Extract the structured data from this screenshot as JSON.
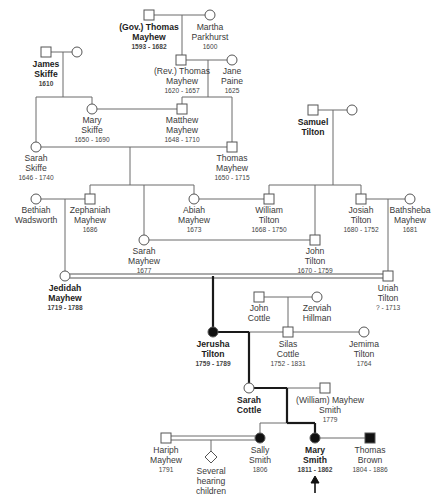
{
  "diagram": {
    "type": "pedigree-chart",
    "colors": {
      "line": "#6b6b6b",
      "bold_line": "#1a1a1a",
      "symbol_stroke": "#555555",
      "affected_fill": "#111111"
    }
  },
  "people": {
    "gov_thomas": {
      "name1": "(Gov.) Thomas",
      "name2": "Mayhew",
      "dates": "1593 - 1682",
      "sex": "male",
      "bold": true
    },
    "martha": {
      "name1": "Martha",
      "name2": "Parkhurst",
      "dates": "1600",
      "sex": "female"
    },
    "james_skiffe": {
      "name1": "James",
      "name2": "Skiffe",
      "dates": "1610",
      "sex": "male",
      "bold": true
    },
    "rev_thomas": {
      "name1": "(Rev.) Thomas",
      "name2": "Mayhew",
      "dates": "1620 - 1657",
      "sex": "male"
    },
    "jane_paine": {
      "name1": "Jane",
      "name2": "Paine",
      "dates": "1625",
      "sex": "female"
    },
    "mary_skiffe": {
      "name1": "Mary",
      "name2": "Skiffe",
      "dates": "1650 - 1690",
      "sex": "female"
    },
    "matthew": {
      "name1": "Matthew",
      "name2": "Mayhew",
      "dates": "1648 - 1710",
      "sex": "male"
    },
    "samuel_tilton": {
      "name1": "Samuel",
      "name2": "Tilton",
      "dates": "",
      "sex": "male",
      "bold": true
    },
    "sarah_skiffe": {
      "name1": "Sarah",
      "name2": "Skiffe",
      "dates": "1646 - 1740",
      "sex": "female"
    },
    "thomas_mayhew": {
      "name1": "Thomas",
      "name2": "Mayhew",
      "dates": "1650 - 1715",
      "sex": "male"
    },
    "bethiah": {
      "name1": "Bethiah",
      "name2": "Wadsworth",
      "dates": "",
      "sex": "female"
    },
    "zephaniah": {
      "name1": "Zephaniah",
      "name2": "Mayhew",
      "dates": "1686",
      "sex": "male"
    },
    "abiah": {
      "name1": "Abiah",
      "name2": "Mayhew",
      "dates": "1673",
      "sex": "female"
    },
    "william_tilton": {
      "name1": "William",
      "name2": "Tilton",
      "dates": "1668 - 1750",
      "sex": "male"
    },
    "josiah": {
      "name1": "Josiah",
      "name2": "Tilton",
      "dates": "1680 - 1752",
      "sex": "male"
    },
    "bathsheba": {
      "name1": "Bathsheba",
      "name2": "Mayhew",
      "dates": "1681",
      "sex": "female"
    },
    "sarah_mayhew": {
      "name1": "Sarah",
      "name2": "Mayhew",
      "dates": "1677",
      "sex": "female"
    },
    "john_tilton": {
      "name1": "John",
      "name2": "Tilton",
      "dates": "1670 - 1759",
      "sex": "male"
    },
    "jedidah": {
      "name1": "Jedidah",
      "name2": "Mayhew",
      "dates": "1719 - 1788",
      "sex": "female",
      "bold": true
    },
    "uriah": {
      "name1": "Uriah",
      "name2": "Tilton",
      "dates": "? - 1713",
      "sex": "male"
    },
    "john_cottle": {
      "name1": "John",
      "name2": "Cottle",
      "dates": "",
      "sex": "male"
    },
    "zerviah": {
      "name1": "Zerviah",
      "name2": "Hillman",
      "dates": "",
      "sex": "female"
    },
    "jerusha": {
      "name1": "Jerusha",
      "name2": "Tilton",
      "dates": "1759 - 1789",
      "sex": "female",
      "affected": true,
      "bold": true
    },
    "silas": {
      "name1": "Silas",
      "name2": "Cottle",
      "dates": "1752 - 1831",
      "sex": "male"
    },
    "jemima": {
      "name1": "Jemima",
      "name2": "Tilton",
      "dates": "1764",
      "sex": "female"
    },
    "sarah_cottle": {
      "name1": "Sarah",
      "name2": "Cottle",
      "dates": "",
      "sex": "female",
      "bold": true
    },
    "william_smith": {
      "name1": "(William) Mayhew",
      "name2": "Smith",
      "dates": "1779",
      "sex": "male"
    },
    "hariph": {
      "name1": "Hariph",
      "name2": "Mayhew",
      "dates": "1791",
      "sex": "male"
    },
    "several": {
      "name1": "Several",
      "name2": "hearing",
      "name3": "children",
      "sex": "unknown"
    },
    "sally": {
      "name1": "Sally",
      "name2": "Smith",
      "dates": "1806",
      "sex": "female",
      "affected": true
    },
    "mary_smith": {
      "name1": "Mary",
      "name2": "Smith",
      "dates": "1811 - 1862",
      "sex": "female",
      "affected": true,
      "bold": true,
      "proband": true
    },
    "thomas_brown": {
      "name1": "Thomas",
      "name2": "Brown",
      "dates": "1804 - 1886",
      "sex": "male",
      "affected": true
    }
  },
  "proband_marker": {
    "symbol": "arrow-up",
    "target": "Mary Smith"
  }
}
